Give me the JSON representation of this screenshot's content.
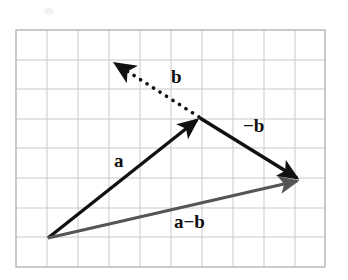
{
  "figure": {
    "kind": "vector-subtraction-diagram",
    "background_color": "#ffffff",
    "grid": {
      "x": 16,
      "y": 30,
      "width": 309,
      "height": 237,
      "cell_width": 31,
      "cell_height": 29.6,
      "columns": 10,
      "rows": 8,
      "line_color": "#c8c8c8",
      "border_color": "#b4b4b4",
      "border_width": 1.2
    },
    "colors": {
      "vector_a": "#111111",
      "vector_b": "#111111",
      "vector_minus_b": "#111111",
      "vector_a_minus_b": "#555555",
      "label_text": "#101010"
    },
    "points": {
      "origin": {
        "x": 48,
        "y": 238
      },
      "apex": {
        "x": 200,
        "y": 118
      },
      "right": {
        "x": 301,
        "y": 180
      },
      "b_tip": {
        "x": 110,
        "y": 60
      }
    },
    "vectors": [
      {
        "id": "a",
        "label": "a",
        "style": "solid",
        "color": "#111111",
        "stroke_width": 3.4,
        "from": {
          "x": 48,
          "y": 238
        },
        "to": {
          "x": 200,
          "y": 118
        },
        "arrowhead": "filled",
        "label_position": {
          "x": 114,
          "y": 151
        }
      },
      {
        "id": "b",
        "label": "b",
        "style": "dotted",
        "color": "#111111",
        "stroke_width": 3.6,
        "dot_gap": 8,
        "from": {
          "x": 200,
          "y": 118
        },
        "to": {
          "x": 110,
          "y": 60
        },
        "arrowhead": "filled",
        "label_position": {
          "x": 171,
          "y": 67
        }
      },
      {
        "id": "minus-b",
        "label": "−b",
        "style": "solid",
        "color": "#111111",
        "stroke_width": 3.4,
        "from": {
          "x": 200,
          "y": 118
        },
        "to": {
          "x": 301,
          "y": 180
        },
        "arrowhead": "filled",
        "label_position": {
          "x": 243,
          "y": 116
        }
      },
      {
        "id": "a-minus-b",
        "label": "a−b",
        "style": "solid",
        "color": "#555555",
        "stroke_width": 3.2,
        "from": {
          "x": 48,
          "y": 238
        },
        "to": {
          "x": 301,
          "y": 180
        },
        "arrowhead": "filled",
        "label_position": {
          "x": 174,
          "y": 212
        }
      }
    ]
  }
}
